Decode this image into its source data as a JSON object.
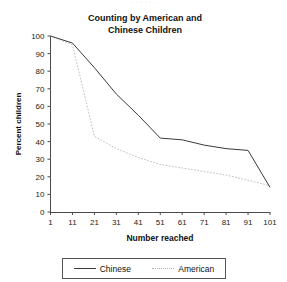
{
  "page": {
    "cut_off_top_text": "· · · · · ·"
  },
  "chart_data": {
    "type": "line",
    "title": "Counting by American and Chinese Children",
    "title_line1": "Counting by American and",
    "title_line2": "Chinese Children",
    "xlabel": "Number reached",
    "ylabel": "Percent children",
    "x": [
      1,
      11,
      21,
      31,
      41,
      51,
      61,
      71,
      81,
      91,
      101
    ],
    "xticklabels": [
      "1",
      "11",
      "21",
      "31",
      "41",
      "51",
      "61",
      "71",
      "81",
      "91",
      "101"
    ],
    "yticklabels": [
      "0",
      "10",
      "20",
      "30",
      "40",
      "50",
      "60",
      "70",
      "80",
      "90",
      "100"
    ],
    "yticks": [
      0,
      10,
      20,
      30,
      40,
      50,
      60,
      70,
      80,
      90,
      100
    ],
    "xlim": [
      1,
      101
    ],
    "ylim": [
      0,
      100
    ],
    "grid": false,
    "legend_position": "bottom",
    "series": [
      {
        "name": "Chinese",
        "style": "solid",
        "color": "#3a3a3a",
        "values": [
          100,
          96,
          82,
          67,
          55,
          42,
          41,
          38,
          36,
          35,
          14
        ]
      },
      {
        "name": "American",
        "style": "dotted",
        "color": "#bdbdbd",
        "values": [
          100,
          95,
          43,
          36,
          31,
          27,
          25,
          23,
          21,
          18,
          15
        ]
      }
    ]
  },
  "legend": {
    "entries": [
      {
        "label": "Chinese",
        "style": "solid"
      },
      {
        "label": "American",
        "style": "dotted"
      }
    ]
  }
}
